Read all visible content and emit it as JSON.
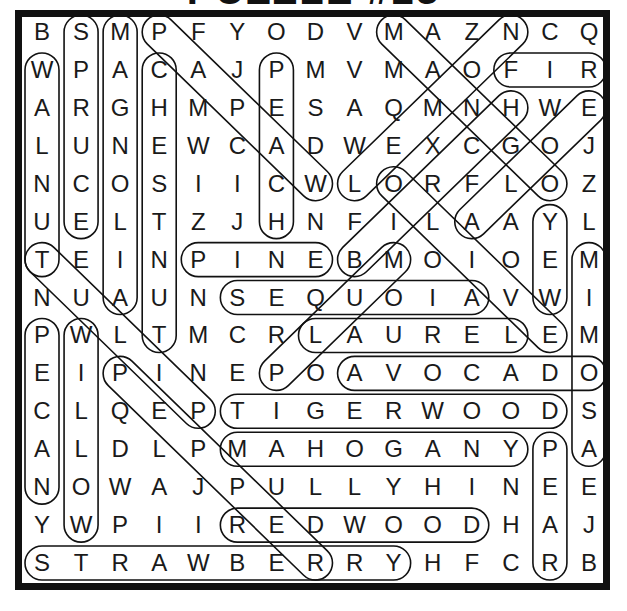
{
  "puzzle": {
    "title": "PUZZLE #23",
    "grid_size": 15,
    "rows": [
      "BSMPFYODVMAZNCQ",
      "WPACAJPMVMAOFIR",
      "ARGHMPESAQMNHWE",
      "LUNEWCADWEXCGOJ",
      "NCOSIICWLORFLOZ",
      "UELTZJHNFILAAYL",
      "TEINPINEBMOIOEM",
      "NUAUNSEQUOIAVWI",
      "PWLTMCRLAURELEM",
      "EIPINEPOAVOCADO",
      "CLQEPTIGERWOODS",
      "ALDLPMAHOGANYPA",
      "NOWAJPULLYHINEE",
      "YWPIIREDWOODHAJ",
      "STRAWBERRYHFCRB"
    ],
    "found_words": [
      {
        "word": "SPRUCE",
        "start": [
          0,
          1
        ],
        "end": [
          5,
          1
        ]
      },
      {
        "word": "MAGNOLIA",
        "start": [
          0,
          2
        ],
        "end": [
          7,
          2
        ]
      },
      {
        "word": "CHESTNUT",
        "start": [
          1,
          3
        ],
        "end": [
          8,
          3
        ]
      },
      {
        "word": "PEACH",
        "start": [
          1,
          6
        ],
        "end": [
          5,
          6
        ]
      },
      {
        "word": "WALNUT",
        "start": [
          1,
          0
        ],
        "end": [
          6,
          0
        ]
      },
      {
        "word": "PINE",
        "start": [
          6,
          4
        ],
        "end": [
          6,
          7
        ]
      },
      {
        "word": "SEQUOIA",
        "start": [
          7,
          5
        ],
        "end": [
          7,
          11
        ]
      },
      {
        "word": "LAUREL",
        "start": [
          8,
          7
        ],
        "end": [
          8,
          12
        ]
      },
      {
        "word": "AVOCADO",
        "start": [
          9,
          8
        ],
        "end": [
          9,
          14
        ]
      },
      {
        "word": "TIGERWOOD",
        "start": [
          10,
          5
        ],
        "end": [
          10,
          13
        ]
      },
      {
        "word": "MAHOGANY",
        "start": [
          11,
          5
        ],
        "end": [
          11,
          12
        ]
      },
      {
        "word": "REDWOOD",
        "start": [
          13,
          5
        ],
        "end": [
          13,
          11
        ]
      },
      {
        "word": "STRAWBERRY",
        "start": [
          14,
          0
        ],
        "end": [
          14,
          9
        ]
      },
      {
        "word": "FIR",
        "start": [
          1,
          12
        ],
        "end": [
          1,
          14
        ]
      },
      {
        "word": "PEAR",
        "start": [
          11,
          13
        ],
        "end": [
          14,
          13
        ]
      },
      {
        "word": "YEW",
        "start": [
          5,
          13
        ],
        "end": [
          7,
          13
        ]
      },
      {
        "word": "MIMOSA",
        "start": [
          6,
          14
        ],
        "end": [
          11,
          14
        ]
      },
      {
        "word": "PECAN",
        "start": [
          8,
          0
        ],
        "end": [
          12,
          0
        ]
      },
      {
        "word": "WILLOW",
        "start": [
          8,
          1
        ],
        "end": [
          13,
          1
        ]
      },
      {
        "word": "PAPAW",
        "start": [
          0,
          3
        ],
        "end": [
          4,
          7
        ]
      },
      {
        "word": "MANGO",
        "start": [
          0,
          9
        ],
        "end": [
          4,
          13
        ]
      },
      {
        "word": "LEMON",
        "start": [
          4,
          8
        ],
        "end": [
          0,
          12
        ]
      },
      {
        "word": "BIRCH",
        "start": [
          6,
          8
        ],
        "end": [
          2,
          12
        ]
      },
      {
        "word": "ALOE",
        "start": [
          5,
          11
        ],
        "end": [
          2,
          14
        ]
      },
      {
        "word": "OLIVE",
        "start": [
          4,
          9
        ],
        "end": [
          8,
          13
        ]
      },
      {
        "word": "PLUM",
        "start": [
          9,
          6
        ],
        "end": [
          6,
          9
        ]
      },
      {
        "word": "TULIP",
        "start": [
          6,
          0
        ],
        "end": [
          10,
          4
        ]
      },
      {
        "word": "PEPPER",
        "start": [
          9,
          2
        ],
        "end": [
          14,
          7
        ]
      }
    ]
  },
  "layout": {
    "origin_x": 42,
    "origin_y": 32,
    "col_pitch": 39.07,
    "row_pitch": 37.93,
    "capsule_radius": 17,
    "ink_color": "#111111"
  }
}
